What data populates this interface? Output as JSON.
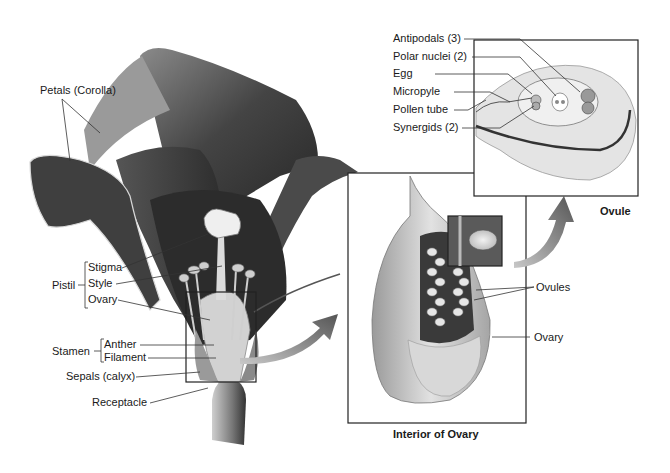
{
  "diagram": {
    "colors": {
      "ink": "#1a1a1a",
      "petal_dark": "#3a3a3a",
      "petal_mid": "#6a6a6a",
      "petal_light": "#bdbdbd",
      "arrow": "#777777",
      "box_border": "#222222"
    },
    "flower_labels": {
      "petals": "Petals (Corolla)",
      "pistil_group": "Pistil",
      "stigma": "Stigma",
      "style": "Style",
      "ovary": "Ovary",
      "stamen_group": "Stamen",
      "anther": "Anther",
      "filament": "Filament",
      "sepals": "Sepals (calyx)",
      "receptacle": "Receptacle"
    },
    "ovary_panel": {
      "caption": "Interior of Ovary",
      "labels": {
        "ovules": "Ovules",
        "ovary": "Ovary"
      }
    },
    "ovule_panel": {
      "caption": "Ovule",
      "labels": {
        "antipodals": "Antipodals (3)",
        "polar_nuclei": "Polar nuclei (2)",
        "egg": "Egg",
        "micropyle": "Micropyle",
        "pollen_tube": "Pollen tube",
        "synergids": "Synergids (2)"
      }
    }
  }
}
